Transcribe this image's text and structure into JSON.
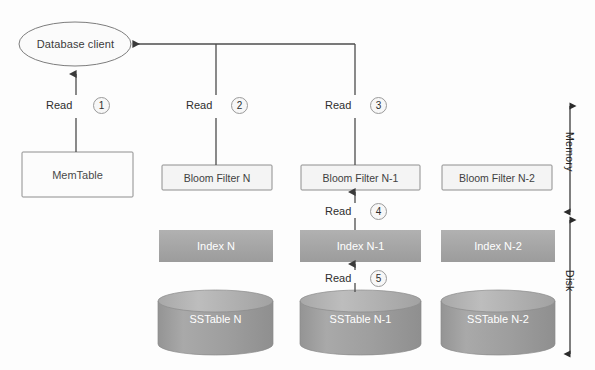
{
  "diagram": {
    "background_color": "#fdfdfd",
    "client": {
      "label": "Database client",
      "fill": "#fbfbfb",
      "stroke": "#7b7b7b"
    },
    "memtable": {
      "label": "MemTable",
      "fill": "#fcfcfc",
      "stroke": "#8c8c8c"
    },
    "bloom_filters": [
      {
        "label": "Bloom Filter N",
        "fill": "#f4f4f4",
        "stroke": "#8c8c8c"
      },
      {
        "label": "Bloom Filter N-1",
        "fill": "#f4f4f4",
        "stroke": "#8c8c8c"
      },
      {
        "label": "Bloom Filter N-2",
        "fill": "#f4f4f4",
        "stroke": "#8c8c8c"
      }
    ],
    "indexes": [
      {
        "label": "Index N",
        "fill": "#a8a8a8"
      },
      {
        "label": "Index N-1",
        "fill": "#a8a8a8"
      },
      {
        "label": "Index N-2",
        "fill": "#a8a8a8"
      }
    ],
    "sstables": [
      {
        "label": "SSTable N",
        "fill": "#9d9d9d",
        "top_fill": "#b4b4b4"
      },
      {
        "label": "SSTable N-1",
        "fill": "#9d9d9d",
        "top_fill": "#b4b4b4"
      },
      {
        "label": "SSTable N-2",
        "fill": "#9d9d9d",
        "top_fill": "#b4b4b4"
      }
    ],
    "steps": [
      {
        "number": "1",
        "label": "Read",
        "from": "MemTable",
        "to": "Database client"
      },
      {
        "number": "2",
        "label": "Read",
        "from": "Bloom Filter N",
        "to": "Database client"
      },
      {
        "number": "3",
        "label": "Read",
        "from": "Bloom Filter N-1",
        "to": "Database client"
      },
      {
        "number": "4",
        "label": "Read",
        "from": "Index N-1",
        "to": "Bloom Filter N-1"
      },
      {
        "number": "5",
        "label": "Read",
        "from": "SSTable N-1",
        "to": "Index N-1"
      }
    ],
    "tiers": [
      {
        "label": "Memory"
      },
      {
        "label": "Disk"
      }
    ],
    "line_color": "#4c4c4c"
  }
}
